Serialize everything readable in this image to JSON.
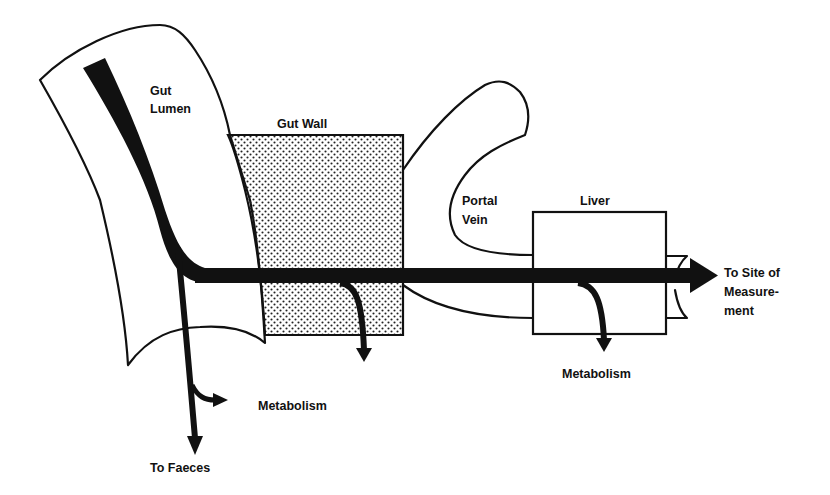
{
  "diagram": {
    "compartments": {
      "gut_lumen": {
        "label_line1": "Gut",
        "label_line2": "Lumen"
      },
      "gut_wall": {
        "label": "Gut Wall"
      },
      "portal_vein": {
        "label_line1": "Portal",
        "label_line2": "Vein"
      },
      "liver": {
        "label": "Liver"
      }
    },
    "outputs": {
      "lumen_metabolism": "Metabolism",
      "to_faeces": "To Faeces",
      "liver_metabolism": "Metabolism",
      "site_line1": "To Site of",
      "site_line2": "Measure-",
      "site_line3": "ment"
    },
    "colors": {
      "ink": "#111111",
      "background": "#ffffff",
      "stipple": "#222222"
    }
  }
}
